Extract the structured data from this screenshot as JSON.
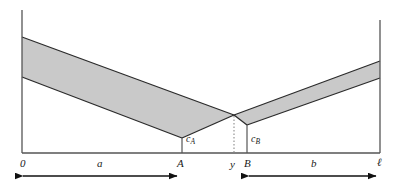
{
  "figure": {
    "type": "line-segment-cost-diagram",
    "colors": {
      "band_fill": "#c9c9c9",
      "band_edge": "#2b2b2b",
      "axis": "#555555",
      "baseline": "#555555",
      "text": "#1a1a1a",
      "background": "#ffffff",
      "dotted_line": "#8a8a8a"
    }
  },
  "axis_labels": [
    {
      "id": "origin",
      "text": "0",
      "x": 20,
      "y": 158
    },
    {
      "id": "point-a",
      "text": "A",
      "x": 177,
      "y": 158
    },
    {
      "id": "point-y",
      "text": "y",
      "x": 230,
      "y": 159
    },
    {
      "id": "point-b",
      "text": "B",
      "x": 244,
      "y": 158
    },
    {
      "id": "point-l",
      "text": "ℓ",
      "x": 377,
      "y": 157
    }
  ],
  "segment_labels": [
    {
      "id": "segment-a",
      "text": "a",
      "x": 97,
      "y": 158
    },
    {
      "id": "segment-b",
      "text": "b",
      "x": 311,
      "y": 158
    }
  ],
  "cost_labels": [
    {
      "id": "cost-a",
      "base": "c",
      "sub": "A",
      "x": 186,
      "y": 134
    },
    {
      "id": "cost-b",
      "base": "c",
      "sub": "B",
      "x": 251,
      "y": 134
    }
  ],
  "geometry": {
    "baseline_y": 153,
    "left_axis_x": 22,
    "right_axis_x": 380,
    "left_axis_top_y": 10,
    "right_axis_top_y": 20,
    "a_tick_x": 182,
    "y_tick_x": 234,
    "b_tick_x": 247,
    "crossing_point": {
      "x": 234,
      "y": 115
    },
    "band_a": {
      "left_upper_y": 37,
      "left_lower_y": 77,
      "vertex_x": 182,
      "vertex_upper_y": 103,
      "vertex_lower_y": 138
    },
    "band_b": {
      "vertex_x": 247,
      "vertex_upper_y": 106,
      "vertex_lower_y": 125,
      "right_upper_y": 61,
      "right_lower_y": 78
    }
  },
  "arrows": [
    {
      "id": "arrow-a",
      "x1": 22,
      "x2": 178,
      "y": 176,
      "label_ref": "a"
    },
    {
      "id": "arrow-b",
      "x1": 248,
      "x2": 377,
      "y": 176,
      "label_ref": "b"
    }
  ]
}
